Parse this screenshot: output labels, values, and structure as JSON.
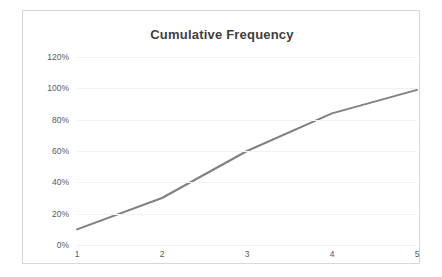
{
  "chart_data": {
    "type": "line",
    "title": "Cumulative Frequency",
    "xlabel": "",
    "ylabel": "",
    "categories": [
      "1",
      "2",
      "3",
      "4",
      "5"
    ],
    "x": [
      1,
      2,
      3,
      4,
      5
    ],
    "values": [
      10,
      30,
      60,
      84,
      99
    ],
    "value_labels": [
      "10%",
      "30%",
      "60%",
      "84%",
      "99%"
    ],
    "series": [
      {
        "name": "Cumulative Frequency",
        "values": [
          10,
          30,
          60,
          84,
          99
        ],
        "color": "#808080"
      }
    ],
    "ylim": [
      0,
      120
    ],
    "yticks": [
      0,
      20,
      40,
      60,
      80,
      100,
      120
    ],
    "ytick_labels": [
      "0%",
      "20%",
      "40%",
      "60%",
      "80%",
      "100%",
      "120%"
    ],
    "xlim": [
      1,
      5
    ],
    "xticks": [
      1,
      2,
      3,
      4,
      5
    ],
    "xtick_labels": [
      "1",
      "2",
      "3",
      "4",
      "5"
    ],
    "grid": true,
    "grid_axis": "y",
    "grid_color": "#f1f1f1",
    "legend": false,
    "legend_position": "none",
    "line_color": "#808080",
    "line_width": 2,
    "markers": false,
    "plot_background": "#ffffff",
    "frame_border_color": "#d8d8d8",
    "title_color": "#404040",
    "tick_label_color": "#59595b"
  }
}
